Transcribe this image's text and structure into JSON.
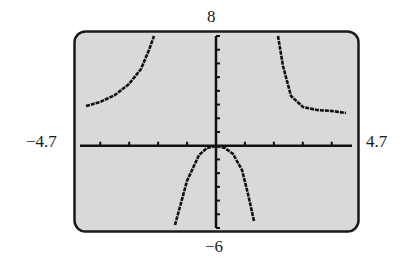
{
  "window": {
    "xmin": "-4.7",
    "xmax": "4.7",
    "ymin": "-6",
    "ymax": "8",
    "xmin_label": "−4.7",
    "xmax_label": "4.7",
    "ymin_label": "−6",
    "ymax_label": "8"
  },
  "colors": {
    "screen_bg": "#d9d9d9",
    "frame": "#1a1a1a",
    "curve": "#111111",
    "axes": "#111111"
  },
  "chart_data": {
    "type": "line",
    "title": "",
    "xlabel": "",
    "ylabel": "",
    "xlim": [
      -4.7,
      4.7
    ],
    "ylim": [
      -6,
      8
    ],
    "x_ticks_step": 1,
    "y_ticks_step": 1,
    "grid": false,
    "vertical_asymptotes": [
      -2,
      2
    ],
    "horizontal_asymptote": 2,
    "series": [
      {
        "name": "left branch",
        "x": [
          -4.5,
          -4.0,
          -3.5,
          -3.0,
          -2.6,
          -2.3,
          -2.15
        ],
        "y": [
          2.9,
          3.2,
          3.7,
          4.5,
          5.6,
          7.0,
          8.0
        ]
      },
      {
        "name": "middle branch",
        "x": [
          -1.4,
          -1.2,
          -1.0,
          -0.6,
          -0.3,
          0,
          0.3,
          0.6,
          0.9,
          1.1,
          1.3
        ],
        "y": [
          -5.8,
          -4.2,
          -2.6,
          -0.7,
          -0.2,
          0,
          -0.2,
          -0.6,
          -1.8,
          -3.5,
          -5.5
        ]
      },
      {
        "name": "right branch",
        "x": [
          2.15,
          2.3,
          2.6,
          3.0,
          3.5,
          4.0,
          4.5
        ],
        "y": [
          8.0,
          5.8,
          3.6,
          2.8,
          2.6,
          2.5,
          2.4
        ]
      }
    ]
  }
}
